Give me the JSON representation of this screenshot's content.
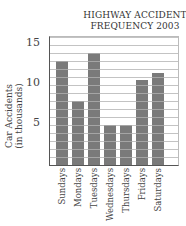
{
  "chart_data": {
    "type": "bar",
    "title": "HIGHWAY ACCIDENT FREQUENCY 2003",
    "title_lines": [
      "HIGHWAY ACCIDENT",
      "FREQUENCY 2003"
    ],
    "xlabel": "",
    "ylabel": "Car Accidents (in thousands)",
    "ylabel_lines": [
      "Car Accidents",
      "(in thousands)"
    ],
    "categories": [
      "Sundays",
      "Mondays",
      "Tuesdays",
      "Wednesdays",
      "Thursdays",
      "Fridays",
      "Saturdays"
    ],
    "values": [
      13,
      8,
      14,
      5,
      5,
      10.6,
      11.5
    ],
    "yticks": [
      5,
      10,
      15
    ],
    "ylim": [
      0,
      16
    ],
    "grid": true,
    "grid_step": 1,
    "legend": null,
    "bar_color": "#7a7a7a",
    "grid_color": "#bdbdbd"
  }
}
